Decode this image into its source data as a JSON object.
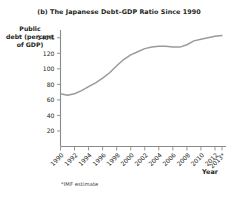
{
  "figure": {
    "panel_title": "(b) The Japanese Debt–GDP Ratio Since 1990",
    "footnote": "*IMF estimate",
    "axis_color": "#8a8a8a",
    "line_color": "#9a9a9a",
    "background": "#ffffff"
  },
  "ylabel": {
    "line1": "Public",
    "line2": "debt (percent",
    "line3": "of GDP)"
  },
  "xlabel": {
    "text": "Year"
  },
  "chart_data": {
    "type": "line",
    "title": "(b) The Japanese Debt–GDP Ratio Since 1990",
    "xlabel": "Year",
    "ylabel": "Public debt (percent of GDP)",
    "ylim": [
      0,
      150
    ],
    "xlim": [
      1990,
      2013
    ],
    "grid": false,
    "legend": null,
    "ytick_labels": [
      "140%",
      "120",
      "100",
      "80",
      "60",
      "40",
      "20"
    ],
    "ytick_values": [
      140,
      120,
      100,
      80,
      60,
      40,
      20
    ],
    "xtick_labels": [
      "1990",
      "1992",
      "1994",
      "1996",
      "1998",
      "2000",
      "2002",
      "2004",
      "2006",
      "2008",
      "2010",
      "2012",
      "2013*"
    ],
    "xtick_values": [
      1990,
      1992,
      1994,
      1996,
      1998,
      2000,
      2002,
      2004,
      2006,
      2008,
      2010,
      2012,
      2013
    ],
    "annotations": [
      "*IMF estimate"
    ],
    "series": [
      {
        "name": "Japan public debt (percent of GDP)",
        "x": [
          1990,
          1991,
          1992,
          1993,
          1994,
          1995,
          1996,
          1997,
          1998,
          1999,
          2000,
          2001,
          2002,
          2003,
          2004,
          2005,
          2006,
          2007,
          2008,
          2009,
          2010,
          2011,
          2012,
          2013
        ],
        "values": [
          68,
          66,
          69,
          74,
          80,
          87,
          93,
          100,
          113,
          127,
          137,
          145,
          154,
          161,
          170,
          174,
          172,
          170,
          174,
          195,
          205,
          214,
          226,
          243
        ]
      }
    ],
    "plot_values_percent": [
      68,
      66,
      69,
      74,
      80,
      87,
      93,
      100,
      113,
      127,
      137,
      145,
      154,
      161,
      170,
      174,
      172,
      170,
      174,
      195,
      205,
      214,
      226,
      243
    ]
  },
  "curve_points_percent": [
    68,
    66,
    68,
    72,
    77,
    82,
    88,
    95,
    104,
    112,
    118,
    122,
    126,
    128,
    129,
    129,
    128,
    128,
    131,
    136,
    138,
    140,
    142,
    143
  ]
}
